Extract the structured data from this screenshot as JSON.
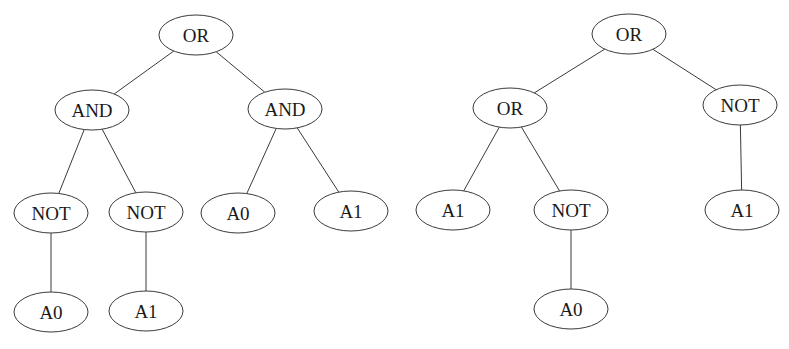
{
  "diagram": {
    "type": "expression-trees",
    "trees": [
      {
        "name": "left-tree",
        "nodes": [
          {
            "id": "l_or",
            "label": "OR",
            "x": 196,
            "y": 35
          },
          {
            "id": "l_and1",
            "label": "AND",
            "x": 92,
            "y": 110
          },
          {
            "id": "l_and2",
            "label": "AND",
            "x": 285,
            "y": 109
          },
          {
            "id": "l_not1",
            "label": "NOT",
            "x": 51,
            "y": 213
          },
          {
            "id": "l_not2",
            "label": "NOT",
            "x": 146,
            "y": 212
          },
          {
            "id": "l_a0",
            "label": "A0",
            "x": 238,
            "y": 213
          },
          {
            "id": "l_a1",
            "label": "A1",
            "x": 351,
            "y": 211
          },
          {
            "id": "l_a0b",
            "label": "A0",
            "x": 51,
            "y": 312
          },
          {
            "id": "l_a1b",
            "label": "A1",
            "x": 146,
            "y": 311
          }
        ],
        "edges": [
          [
            "l_or",
            "l_and1"
          ],
          [
            "l_or",
            "l_and2"
          ],
          [
            "l_and1",
            "l_not1"
          ],
          [
            "l_and1",
            "l_not2"
          ],
          [
            "l_and2",
            "l_a0"
          ],
          [
            "l_and2",
            "l_a1"
          ],
          [
            "l_not1",
            "l_a0b"
          ],
          [
            "l_not2",
            "l_a1b"
          ]
        ]
      },
      {
        "name": "right-tree",
        "nodes": [
          {
            "id": "r_or",
            "label": "OR",
            "x": 629,
            "y": 34
          },
          {
            "id": "r_or2",
            "label": "OR",
            "x": 510,
            "y": 108
          },
          {
            "id": "r_not1",
            "label": "NOT",
            "x": 740,
            "y": 105
          },
          {
            "id": "r_a1",
            "label": "A1",
            "x": 453,
            "y": 210
          },
          {
            "id": "r_not2",
            "label": "NOT",
            "x": 571,
            "y": 210
          },
          {
            "id": "r_a1b",
            "label": "A1",
            "x": 742,
            "y": 210
          },
          {
            "id": "r_a0",
            "label": "A0",
            "x": 571,
            "y": 309
          }
        ],
        "edges": [
          [
            "r_or",
            "r_or2"
          ],
          [
            "r_or",
            "r_not1"
          ],
          [
            "r_or2",
            "r_a1"
          ],
          [
            "r_or2",
            "r_not2"
          ],
          [
            "r_not1",
            "r_a1b"
          ],
          [
            "r_not2",
            "r_a0"
          ]
        ]
      }
    ],
    "node_rx": 37,
    "node_ry": 20,
    "colors": {
      "stroke": "#3a3a3a",
      "text": "#1a1a1a",
      "background": "#ffffff"
    }
  }
}
